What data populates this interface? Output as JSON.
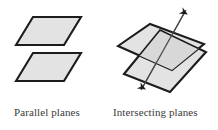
{
  "figure": {
    "background_color": "#ffffff",
    "panels": [
      {
        "id": "parallel-planes",
        "caption": "Parallel planes",
        "description": "Two congruent shaded parallelograms stacked vertically without touching",
        "plane_count": 2
      },
      {
        "id": "intersecting-planes",
        "caption": "Intersecting planes",
        "description": "Two shaded parallelograms crossing each other with a double-headed arrow drawn along the line of intersection",
        "plane_count": 2,
        "intersection_line": "double-headed arrow"
      }
    ]
  },
  "colors": {
    "plane_fill": "#e3e3e3",
    "plane_fill_overlap": "#d8d8d8",
    "plane_stroke": "#1c1c1c",
    "line_stroke": "#4a4a4a",
    "caption_text": "#3a3a3a"
  },
  "geometry": {
    "parallel": {
      "plane_top": "16,45 33,17 81,17 64,45",
      "plane_bottom": "16,81 33,53 81,53 64,81"
    },
    "intersecting": {
      "plane_a": "118,46 150,24 204,44 172,70",
      "plane_b": "124,74 160,30 206,52 170,92",
      "arrow_start": "186,10",
      "arrow_end": "141,90"
    }
  }
}
